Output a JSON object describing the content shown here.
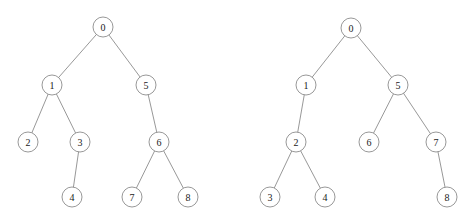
{
  "figure": {
    "background_color": "#ffffff",
    "node_stroke_color": "#8c8c8c",
    "node_fill_color": "#ffffff",
    "edge_color": "#8c8c8c",
    "label_color": "#1a1a1a",
    "node_radius": 10
  },
  "trees": [
    {
      "id": "left-tree",
      "name": "left-tree",
      "nodes": [
        {
          "id": "L0",
          "label": "0",
          "cx": 103,
          "cy": 27
        },
        {
          "id": "L1",
          "label": "1",
          "cx": 52,
          "cy": 85
        },
        {
          "id": "L5",
          "label": "5",
          "cx": 146,
          "cy": 85
        },
        {
          "id": "L2",
          "label": "2",
          "cx": 28,
          "cy": 142
        },
        {
          "id": "L3",
          "label": "3",
          "cx": 80,
          "cy": 142
        },
        {
          "id": "L6",
          "label": "6",
          "cx": 159,
          "cy": 142
        },
        {
          "id": "L4",
          "label": "4",
          "cx": 72,
          "cy": 197
        },
        {
          "id": "L7",
          "label": "7",
          "cx": 132,
          "cy": 197
        },
        {
          "id": "L8",
          "label": "8",
          "cx": 188,
          "cy": 197
        }
      ],
      "edges": [
        {
          "from": "L0",
          "to": "L1"
        },
        {
          "from": "L0",
          "to": "L5"
        },
        {
          "from": "L1",
          "to": "L2"
        },
        {
          "from": "L1",
          "to": "L3"
        },
        {
          "from": "L3",
          "to": "L4"
        },
        {
          "from": "L5",
          "to": "L6"
        },
        {
          "from": "L6",
          "to": "L7"
        },
        {
          "from": "L6",
          "to": "L8"
        }
      ]
    },
    {
      "id": "right-tree",
      "name": "right-tree",
      "nodes": [
        {
          "id": "R0",
          "label": "0",
          "cx": 351,
          "cy": 28
        },
        {
          "id": "R1",
          "label": "1",
          "cx": 306,
          "cy": 85
        },
        {
          "id": "R5",
          "label": "5",
          "cx": 398,
          "cy": 85
        },
        {
          "id": "R2",
          "label": "2",
          "cx": 296,
          "cy": 142
        },
        {
          "id": "R6",
          "label": "6",
          "cx": 369,
          "cy": 142
        },
        {
          "id": "R7",
          "label": "7",
          "cx": 436,
          "cy": 142
        },
        {
          "id": "R3",
          "label": "3",
          "cx": 270,
          "cy": 197
        },
        {
          "id": "R4",
          "label": "4",
          "cx": 325,
          "cy": 197
        },
        {
          "id": "R8",
          "label": "8",
          "cx": 447,
          "cy": 197
        }
      ],
      "edges": [
        {
          "from": "R0",
          "to": "R1"
        },
        {
          "from": "R0",
          "to": "R5"
        },
        {
          "from": "R1",
          "to": "R2"
        },
        {
          "from": "R2",
          "to": "R3"
        },
        {
          "from": "R2",
          "to": "R4"
        },
        {
          "from": "R5",
          "to": "R6"
        },
        {
          "from": "R5",
          "to": "R7"
        },
        {
          "from": "R7",
          "to": "R8"
        }
      ]
    }
  ]
}
